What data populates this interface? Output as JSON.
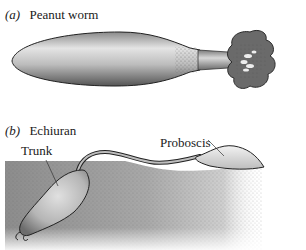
{
  "panels": [
    {
      "id": "a",
      "letter": "(a)",
      "title": "Peanut worm"
    },
    {
      "id": "b",
      "letter": "(b)",
      "title": "Echiuran",
      "annotations": [
        {
          "label": "Trunk"
        },
        {
          "label": "Proboscis"
        }
      ]
    }
  ],
  "colors": {
    "body_light": "#e6e6e6",
    "body_dark": "#6e6e6e",
    "outline": "#222222",
    "sediment": "#9a9a9a"
  }
}
